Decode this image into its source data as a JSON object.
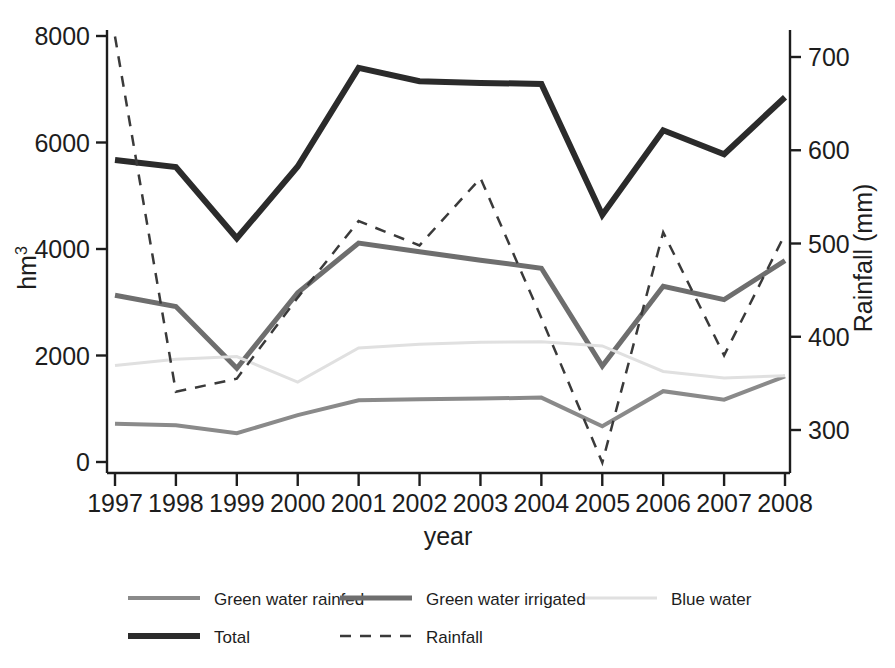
{
  "chart_data": {
    "type": "line",
    "title": "",
    "xlabel": "year",
    "ylabel": "hm3",
    "ylabel_display": "hm",
    "ylabel_superscript": "3",
    "y2label": "Rainfall (mm)",
    "categories": [
      "1997",
      "1998",
      "1999",
      "2000",
      "2001",
      "2002",
      "2003",
      "2004",
      "2005",
      "2006",
      "2007",
      "2008"
    ],
    "ylim": [
      0,
      8400
    ],
    "yticks": [
      0,
      2000,
      4000,
      6000,
      8000
    ],
    "ytick_labels": [
      "0",
      "2000",
      "4000",
      "6000",
      "8000"
    ],
    "y2lim": [
      260,
      740
    ],
    "y2ticks": [
      300,
      400,
      500,
      600,
      700
    ],
    "y2tick_labels": [
      "300",
      "400",
      "500",
      "600",
      "700"
    ],
    "grid": false,
    "legend_position": "bottom",
    "series": [
      {
        "name": "Green water rainfed",
        "axis": "left",
        "style": "solid",
        "color": "#8a8a8a",
        "width": 4,
        "values": [
          720,
          690,
          540,
          880,
          1160,
          1180,
          1190,
          1210,
          670,
          1330,
          1170,
          1610
        ]
      },
      {
        "name": "Green water irrigated",
        "axis": "left",
        "style": "solid",
        "color": "#6e6e6e",
        "width": 5,
        "values": [
          3130,
          2920,
          1760,
          3180,
          4110,
          3950,
          3790,
          3640,
          1800,
          3300,
          3050,
          3780
        ]
      },
      {
        "name": "Blue water",
        "axis": "left",
        "style": "solid",
        "color": "#e0e0e0",
        "width": 3,
        "values": [
          1810,
          1930,
          1980,
          1500,
          2140,
          2210,
          2250,
          2260,
          2180,
          1700,
          1580,
          1620
        ]
      },
      {
        "name": "Total",
        "axis": "left",
        "style": "solid",
        "color": "#2b2b2b",
        "width": 6,
        "values": [
          5670,
          5540,
          4200,
          5550,
          7400,
          7150,
          7120,
          7100,
          4640,
          6230,
          5780,
          6850
        ]
      },
      {
        "name": "Rainfall",
        "axis": "right",
        "style": "dashed",
        "color": "#3a3a3a",
        "width": 2.5,
        "values": [
          722,
          341,
          355,
          442,
          524,
          498,
          570,
          420,
          265,
          512,
          380,
          510
        ]
      }
    ]
  },
  "legend": {
    "row1": [
      {
        "label": "Green water rainfed"
      },
      {
        "label": "Green water irrigated"
      },
      {
        "label": "Blue water"
      }
    ],
    "row2": [
      {
        "label": "Total"
      },
      {
        "label": "Rainfall"
      }
    ]
  }
}
